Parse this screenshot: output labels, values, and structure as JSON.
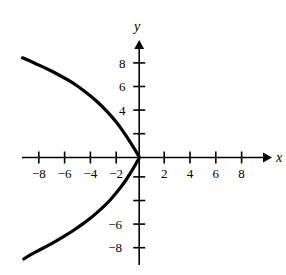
{
  "figure": {
    "background_color": "#ffffff",
    "ink_color": "#000000"
  },
  "chart_data": {
    "type": "line",
    "title": "",
    "subtitle": "",
    "xlabel": "x",
    "ylabel": "y",
    "xlim": [
      -9.6,
      10.0
    ],
    "ylim": [
      -9.6,
      9.6
    ],
    "grid": false,
    "legend": null,
    "annotations": [],
    "equation": "x = -y^2/10",
    "x_ticks": [
      -8,
      -6,
      -4,
      -2,
      2,
      4,
      6,
      8
    ],
    "x_tick_labels": [
      "-8",
      "-6",
      "-4",
      "-2",
      "2",
      "4",
      "6",
      "8"
    ],
    "y_ticks": [
      8,
      6,
      4,
      2,
      -2,
      -4,
      -6,
      -8
    ],
    "y_tick_labels": [
      "8",
      "6",
      "4",
      "",
      "",
      "",
      "-6",
      "-8"
    ],
    "series": [
      {
        "name": "parabola",
        "color": "#000000",
        "line_width": 3.2,
        "points": [
          {
            "x": -9.05,
            "y": 8.45
          },
          {
            "x": -8.3,
            "y": 8.1
          },
          {
            "x": -7.55,
            "y": 7.72
          },
          {
            "x": -6.85,
            "y": 7.35
          },
          {
            "x": -6.15,
            "y": 6.95
          },
          {
            "x": -5.5,
            "y": 6.55
          },
          {
            "x": -4.85,
            "y": 6.1
          },
          {
            "x": -4.25,
            "y": 5.62
          },
          {
            "x": -3.7,
            "y": 5.15
          },
          {
            "x": -3.15,
            "y": 4.62
          },
          {
            "x": -2.65,
            "y": 4.08
          },
          {
            "x": -2.2,
            "y": 3.55
          },
          {
            "x": -1.78,
            "y": 3.0
          },
          {
            "x": -1.4,
            "y": 2.45
          },
          {
            "x": -1.05,
            "y": 1.9
          },
          {
            "x": -0.72,
            "y": 1.35
          },
          {
            "x": -0.42,
            "y": 0.82
          },
          {
            "x": -0.18,
            "y": 0.38
          },
          {
            "x": 0.0,
            "y": 0.0
          },
          {
            "x": -0.18,
            "y": -0.38
          },
          {
            "x": -0.42,
            "y": -0.85
          },
          {
            "x": -0.72,
            "y": -1.38
          },
          {
            "x": -1.05,
            "y": -1.95
          },
          {
            "x": -1.42,
            "y": -2.5
          },
          {
            "x": -1.82,
            "y": -3.05
          },
          {
            "x": -2.25,
            "y": -3.6
          },
          {
            "x": -2.72,
            "y": -4.12
          },
          {
            "x": -3.25,
            "y": -4.65
          },
          {
            "x": -3.82,
            "y": -5.18
          },
          {
            "x": -4.4,
            "y": -5.65
          },
          {
            "x": -5.02,
            "y": -6.12
          },
          {
            "x": -5.68,
            "y": -6.58
          },
          {
            "x": -6.35,
            "y": -7.02
          },
          {
            "x": -7.05,
            "y": -7.45
          },
          {
            "x": -7.8,
            "y": -7.88
          },
          {
            "x": -8.6,
            "y": -8.35
          },
          {
            "x": -8.95,
            "y": -8.6
          }
        ]
      }
    ]
  },
  "labels": {
    "x_axis_name": "x",
    "y_axis_name": "y",
    "x": {
      "m8": "−8",
      "m6": "−6",
      "m4": "−4",
      "m2": "−2",
      "p2": "2",
      "p4": "4",
      "p6": "6",
      "p8": "8"
    },
    "y": {
      "p8": "8",
      "p6": "6",
      "p4": "4",
      "m6": "−6",
      "m8": "−8"
    }
  }
}
